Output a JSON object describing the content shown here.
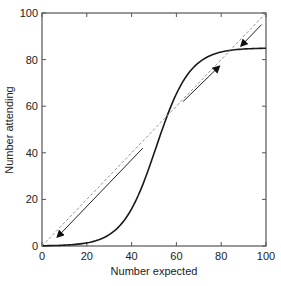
{
  "chart_data": {
    "type": "line",
    "title": "",
    "xlabel": "Number expected",
    "ylabel": "Number attending",
    "xlim": [
      0,
      100
    ],
    "ylim": [
      0,
      100
    ],
    "xticks": [
      0,
      20,
      40,
      60,
      80,
      100
    ],
    "yticks": [
      0,
      20,
      40,
      60,
      80,
      100
    ],
    "grid": false,
    "legend": null,
    "series": [
      {
        "name": "attendance-curve",
        "style": "solid",
        "color": "#1a1a1a",
        "x": [
          0,
          10,
          20,
          30,
          35,
          40,
          45,
          50,
          55,
          60,
          65,
          70,
          75,
          80,
          85,
          90,
          95,
          100
        ],
        "y": [
          0.1,
          0.5,
          1.3,
          4.6,
          8.6,
          15.9,
          26.9,
          41.2,
          53.6,
          66.8,
          75.4,
          80.3,
          82.8,
          83.9,
          84.5,
          84.8,
          84.9,
          85.0
        ]
      },
      {
        "name": "diagonal-y-equals-x",
        "style": "dashed",
        "color": "#888888",
        "x": [
          0,
          100
        ],
        "y": [
          0,
          100
        ]
      }
    ],
    "annotations": [
      {
        "type": "arrow",
        "from": [
          45,
          42
        ],
        "to": [
          7,
          4
        ],
        "direction": "down-left"
      },
      {
        "type": "arrow",
        "from": [
          63,
          62
        ],
        "to": [
          79,
          77
        ],
        "direction": "up-right"
      },
      {
        "type": "arrow",
        "from": [
          98,
          95
        ],
        "to": [
          89,
          86
        ],
        "direction": "down-left"
      }
    ]
  },
  "labels": {
    "x_axis": "Number expected",
    "y_axis": "Number attending",
    "x_ticks": [
      "0",
      "20",
      "40",
      "60",
      "80",
      "100"
    ],
    "y_ticks": [
      "0",
      "20",
      "40",
      "60",
      "80",
      "100"
    ]
  }
}
